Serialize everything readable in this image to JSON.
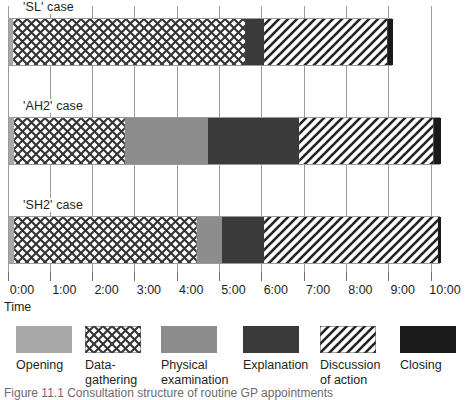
{
  "chart_data": {
    "type": "bar",
    "orientation": "horizontal-stacked",
    "title": "",
    "xlabel": "Time",
    "ylabel": "",
    "xlim": [
      0,
      10
    ],
    "xtick_labels": [
      "0:00",
      "1:00",
      "2:00",
      "3:00",
      "4:00",
      "5:00",
      "6:00",
      "7:00",
      "8:00",
      "9:00",
      "10:00"
    ],
    "xtick_values": [
      0,
      1,
      2,
      3,
      4,
      5,
      6,
      7,
      8,
      9,
      10
    ],
    "grid": true,
    "grid_axis": "x",
    "legend_position": "bottom",
    "categories": [
      "'SL' case",
      "'AH2' case",
      "'SH2' case"
    ],
    "series": [
      {
        "name": "Opening",
        "key": "opening",
        "values": [
          0.1,
          0.12,
          0.12
        ]
      },
      {
        "name": "Data-gathering",
        "key": "data",
        "values": [
          5.48,
          2.62,
          4.32
        ]
      },
      {
        "name": "Physical examination",
        "key": "physical",
        "values": [
          0.0,
          1.96,
          0.59
        ]
      },
      {
        "name": "Explanation",
        "key": "explanation",
        "values": [
          0.45,
          2.16,
          0.99
        ]
      },
      {
        "name": "Discussion of action",
        "key": "discussion",
        "values": [
          2.91,
          3.17,
          4.11
        ]
      },
      {
        "name": "Closing",
        "key": "closing",
        "values": [
          0.14,
          0.19,
          0.08
        ]
      }
    ],
    "bars": [
      {
        "label": "'SL' case",
        "segments": [
          {
            "key": "opening",
            "start": 0.0,
            "end": 0.1
          },
          {
            "key": "data",
            "start": 0.1,
            "end": 5.58
          },
          {
            "key": "explanation",
            "start": 5.58,
            "end": 6.03
          },
          {
            "key": "discussion",
            "start": 6.03,
            "end": 8.94
          },
          {
            "key": "closing",
            "start": 8.94,
            "end": 9.08
          }
        ]
      },
      {
        "label": "'AH2' case",
        "segments": [
          {
            "key": "opening",
            "start": 0.0,
            "end": 0.12
          },
          {
            "key": "data",
            "start": 0.12,
            "end": 2.74
          },
          {
            "key": "physical",
            "start": 2.74,
            "end": 4.7
          },
          {
            "key": "explanation",
            "start": 4.7,
            "end": 6.86
          },
          {
            "key": "discussion",
            "start": 6.86,
            "end": 10.03
          },
          {
            "key": "closing",
            "start": 10.03,
            "end": 10.22
          }
        ]
      },
      {
        "label": "'SH2' case",
        "segments": [
          {
            "key": "opening",
            "start": 0.0,
            "end": 0.12
          },
          {
            "key": "data",
            "start": 0.12,
            "end": 4.44
          },
          {
            "key": "physical",
            "start": 4.44,
            "end": 5.03
          },
          {
            "key": "explanation",
            "start": 5.03,
            "end": 6.03
          },
          {
            "key": "discussion",
            "start": 6.03,
            "end": 10.14
          },
          {
            "key": "closing",
            "start": 10.14,
            "end": 10.22
          }
        ]
      }
    ]
  },
  "axis": {
    "name": "Time",
    "ticks": [
      "0:00",
      "1:00",
      "2:00",
      "3:00",
      "4:00",
      "5:00",
      "6:00",
      "7:00",
      "8:00",
      "9:00",
      "10:00"
    ]
  },
  "rows": [
    {
      "label": "'SL' case"
    },
    {
      "label": "'AH2' case"
    },
    {
      "label": "'SH2' case"
    }
  ],
  "legend": {
    "items": [
      {
        "label": "Opening",
        "key": "opening",
        "fill": "#a8a8a8"
      },
      {
        "label": "Data-\ngathering",
        "key": "data",
        "fill": "crosshatch"
      },
      {
        "label": "Physical\nexamination",
        "key": "physical",
        "fill": "#8d8d8d"
      },
      {
        "label": "Explanation",
        "key": "explanation",
        "fill": "#3a3a3a"
      },
      {
        "label": "Discussion\nof action",
        "key": "discussion",
        "fill": "diagonal"
      },
      {
        "label": "Closing",
        "key": "closing",
        "fill": "#1a1a1a"
      }
    ]
  },
  "caption": {
    "text": "Figure 11.1 Consultation structure of routine GP appointments"
  },
  "colors": {
    "opening": "#a8a8a8",
    "physical": "#8d8d8d",
    "explanation": "#3a3a3a",
    "closing": "#1a1a1a",
    "gridline": "#9a9a9a",
    "text": "#231f20"
  }
}
